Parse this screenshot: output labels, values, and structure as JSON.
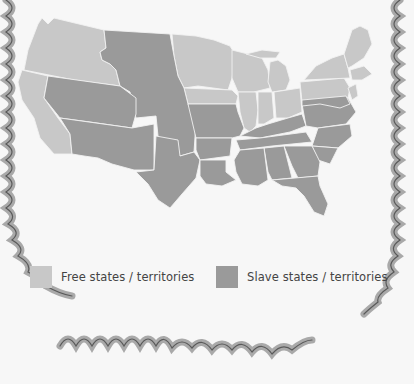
{
  "map": {
    "title": "Free and slave states / territories",
    "colors": {
      "background": "#f7f7f7",
      "free": "#c8c8c8",
      "slave": "#9a9a9a",
      "border_line": "#f2f2f2",
      "frame_shadow": "#a9a9a9",
      "frame_line": "#5a5a5a"
    }
  },
  "legend": {
    "items": [
      {
        "label": "Free states / territories",
        "color": "#c8c8c8"
      },
      {
        "label": "Slave states / territories",
        "color": "#9a9a9a"
      }
    ]
  }
}
